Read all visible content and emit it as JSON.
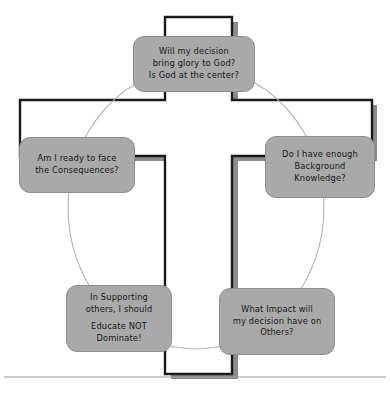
{
  "diagram": {
    "colors": {
      "node_fill": "#a9a9a9",
      "node_border": "#8e8e8e",
      "cross_outline": "#1a1a1a",
      "cross_shadow": "#8c8c8c",
      "cross_fill": "#ffffff",
      "circle_stroke": "#b0b0b0",
      "ground_line": "#9a9a9a",
      "text": "#171717",
      "background": "#ffffff"
    },
    "shapes": {
      "cross_label": "cross",
      "circle_label": "decision-cycle-circle",
      "ground_label": "ground-line"
    },
    "nodes": [
      {
        "id": "top",
        "name": "node-glory-to-god",
        "lines": [
          "Will my decision",
          "bring glory to God?",
          "Is God at the center?"
        ]
      },
      {
        "id": "left",
        "name": "node-consequences",
        "lines": [
          "Am I ready to face",
          "the  Consequences?"
        ]
      },
      {
        "id": "right",
        "name": "node-background-knowledge",
        "lines": [
          "Do I have enough",
          "Background",
          "Knowledge?"
        ]
      },
      {
        "id": "bottom-left",
        "name": "node-educate-not-dominate",
        "lines": [
          "In Supporting",
          "others, I should"
        ],
        "lines2": [
          "Educate NOT",
          "Dominate!"
        ]
      },
      {
        "id": "bottom-right",
        "name": "node-impact-on-others",
        "lines": [
          "What Impact will",
          "my decision have on",
          "Others?"
        ]
      }
    ]
  }
}
